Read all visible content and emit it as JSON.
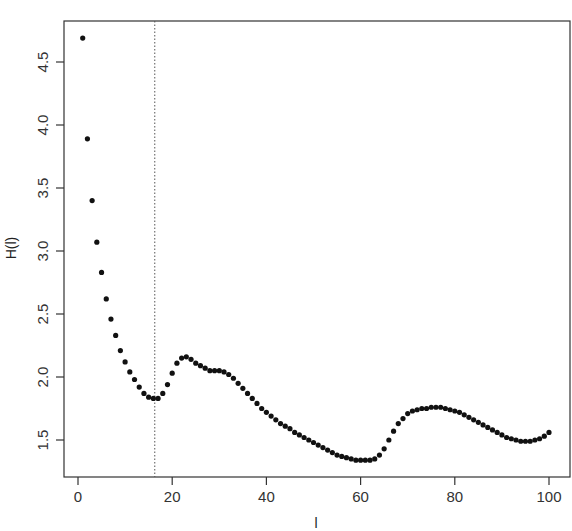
{
  "chart_data": {
    "type": "scatter",
    "title": "",
    "xlabel": "l",
    "ylabel": "H(l)",
    "xlim": [
      -2,
      105
    ],
    "ylim": [
      1.2,
      4.8
    ],
    "x_ticks": [
      0,
      20,
      40,
      60,
      80,
      100
    ],
    "y_ticks": [
      1.5,
      2.0,
      2.5,
      3.0,
      3.5,
      4.0,
      4.5
    ],
    "grid": false,
    "legend": null,
    "vline": {
      "x": 16,
      "style": "dotted"
    },
    "x": [
      1,
      2,
      3,
      4,
      5,
      6,
      7,
      8,
      9,
      10,
      11,
      12,
      13,
      14,
      15,
      16,
      17,
      18,
      19,
      20,
      21,
      22,
      23,
      24,
      25,
      26,
      27,
      28,
      29,
      30,
      31,
      32,
      33,
      34,
      35,
      36,
      37,
      38,
      39,
      40,
      41,
      42,
      43,
      44,
      45,
      46,
      47,
      48,
      49,
      50,
      51,
      52,
      53,
      54,
      55,
      56,
      57,
      58,
      59,
      60,
      61,
      62,
      63,
      64,
      65,
      66,
      67,
      68,
      69,
      70,
      71,
      72,
      73,
      74,
      75,
      76,
      77,
      78,
      79,
      80,
      81,
      82,
      83,
      84,
      85,
      86,
      87,
      88,
      89,
      90,
      91,
      92,
      93,
      94,
      95,
      96,
      97,
      98,
      99,
      100
    ],
    "values": [
      4.69,
      3.89,
      3.4,
      3.07,
      2.83,
      2.62,
      2.46,
      2.33,
      2.21,
      2.12,
      2.04,
      1.98,
      1.92,
      1.87,
      1.84,
      1.83,
      1.83,
      1.87,
      1.94,
      2.03,
      2.11,
      2.15,
      2.16,
      2.14,
      2.11,
      2.09,
      2.07,
      2.05,
      2.05,
      2.05,
      2.04,
      2.02,
      1.99,
      1.95,
      1.91,
      1.87,
      1.83,
      1.79,
      1.75,
      1.72,
      1.69,
      1.66,
      1.63,
      1.61,
      1.59,
      1.56,
      1.54,
      1.52,
      1.5,
      1.48,
      1.46,
      1.44,
      1.42,
      1.4,
      1.38,
      1.37,
      1.36,
      1.35,
      1.34,
      1.34,
      1.34,
      1.34,
      1.35,
      1.38,
      1.43,
      1.5,
      1.57,
      1.63,
      1.67,
      1.71,
      1.73,
      1.74,
      1.75,
      1.75,
      1.76,
      1.76,
      1.76,
      1.75,
      1.74,
      1.73,
      1.72,
      1.7,
      1.68,
      1.66,
      1.64,
      1.62,
      1.6,
      1.58,
      1.56,
      1.54,
      1.52,
      1.51,
      1.5,
      1.49,
      1.49,
      1.49,
      1.5,
      1.51,
      1.53,
      1.56
    ]
  }
}
